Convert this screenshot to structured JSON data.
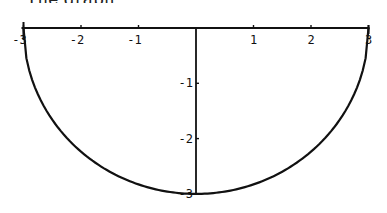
{
  "caption": "The graph",
  "chart_data": {
    "type": "line",
    "title": "",
    "xlabel": "",
    "ylabel": "",
    "xlim": [
      -3,
      3
    ],
    "ylim": [
      -3,
      0
    ],
    "grid": false,
    "x_ticks": [
      -3,
      -2,
      -1,
      1,
      2,
      3
    ],
    "x_tick_labels": [
      "-3",
      "-2",
      "-1",
      "1",
      "2",
      "3"
    ],
    "y_ticks": [
      -1,
      -2,
      -3
    ],
    "y_tick_labels": [
      "-1",
      "-2",
      "-3"
    ],
    "series": [
      {
        "name": "y = -sqrt(9 - x^2)",
        "x": [
          -3,
          -2.5,
          -2,
          -1.5,
          -1,
          -0.5,
          0,
          0.5,
          1,
          1.5,
          2,
          2.5,
          3
        ],
        "y": [
          0,
          -1.66,
          -2.24,
          -2.6,
          -2.83,
          -2.96,
          -3,
          -2.96,
          -2.83,
          -2.6,
          -2.24,
          -1.66,
          0
        ]
      }
    ],
    "frame": {
      "top_axis_line": true,
      "right_vertical_line_at_x": 3
    }
  },
  "layout": {
    "x0_px": 196,
    "x_scale_px": 57.5,
    "y0_px": 28,
    "y_scale_px": 55.3
  }
}
